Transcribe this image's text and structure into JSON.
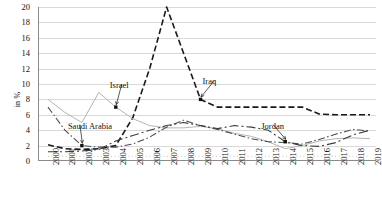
{
  "chart_data": {
    "type": "line",
    "title": "",
    "xlabel": "",
    "ylabel": "in %",
    "ylim": [
      0,
      20
    ],
    "ytick_step": 2,
    "grid": true,
    "legend_position": "inline-annotations",
    "categories": [
      "2000",
      "2001",
      "2002",
      "2003",
      "2004",
      "2005",
      "2006",
      "2007",
      "2008",
      "2009",
      "2010",
      "2011",
      "2012",
      "2013",
      "2014",
      "2015",
      "2016",
      "2017",
      "2018",
      "2019"
    ],
    "series": [
      {
        "name": "Iraq",
        "style": "dashed",
        "color": "#1a1a1a",
        "values": [
          2.1,
          1.6,
          1.5,
          1.6,
          2.0,
          5.6,
          12.0,
          20.0,
          14.0,
          8.0,
          7.0,
          7.0,
          7.0,
          7.0,
          7.0,
          7.0,
          6.1,
          6.0,
          6.0,
          6.0
        ]
      },
      {
        "name": "Israel",
        "style": "solid",
        "color": "#b4b4b4",
        "values": [
          8.0,
          6.3,
          5.0,
          8.9,
          7.0,
          5.5,
          4.6,
          4.3,
          4.3,
          4.5,
          4.2,
          3.6,
          3.2,
          2.5,
          1.6,
          2.0,
          2.6,
          2.9,
          3.0,
          2.9
        ]
      },
      {
        "name": "Saudi Arabia",
        "style": "dash-dot",
        "color": "#4d4d4d",
        "values": [
          7.0,
          4.0,
          2.0,
          1.8,
          1.8,
          2.2,
          3.1,
          4.4,
          5.3,
          4.6,
          4.1,
          3.5,
          2.9,
          2.5,
          2.4,
          2.2,
          2.8,
          3.5,
          4.1,
          3.9
        ]
      },
      {
        "name": "Jordan",
        "style": "dash-dot-long",
        "color": "#3d3d3d",
        "values": [
          1.2,
          1.2,
          1.3,
          1.5,
          2.6,
          3.3,
          4.0,
          4.6,
          5.0,
          4.6,
          4.2,
          4.6,
          4.4,
          4.0,
          2.5,
          2.0,
          1.9,
          2.4,
          3.4,
          4.0
        ]
      },
      {
        "name": "unlabeled-series",
        "style": "dotted",
        "color": "#c2c2c2",
        "values": [
          0.6,
          0.6,
          0.6,
          0.6,
          0.6,
          0.6,
          0.6,
          0.6,
          0.6,
          0.6,
          0.6,
          0.6,
          0.6,
          0.6,
          0.6,
          0.6,
          0.6,
          0.6,
          0.6,
          0.6
        ]
      }
    ],
    "annotations": [
      {
        "label": "Israel",
        "series": "Israel",
        "at_year": "2004"
      },
      {
        "label": "Saudi Arabia",
        "series": "Saudi Arabia",
        "at_year": "2002"
      },
      {
        "label": "Iraq",
        "series": "Iraq",
        "at_year": "2009"
      },
      {
        "label": "Jordan",
        "series": "Jordan",
        "at_year": "2014"
      }
    ]
  },
  "axis": {
    "y_ticks": [
      "20",
      "18",
      "16",
      "14",
      "12",
      "10",
      "8",
      "6",
      "4",
      "2",
      "0"
    ],
    "y_title": "in %"
  },
  "caption": {
    "text": ""
  }
}
